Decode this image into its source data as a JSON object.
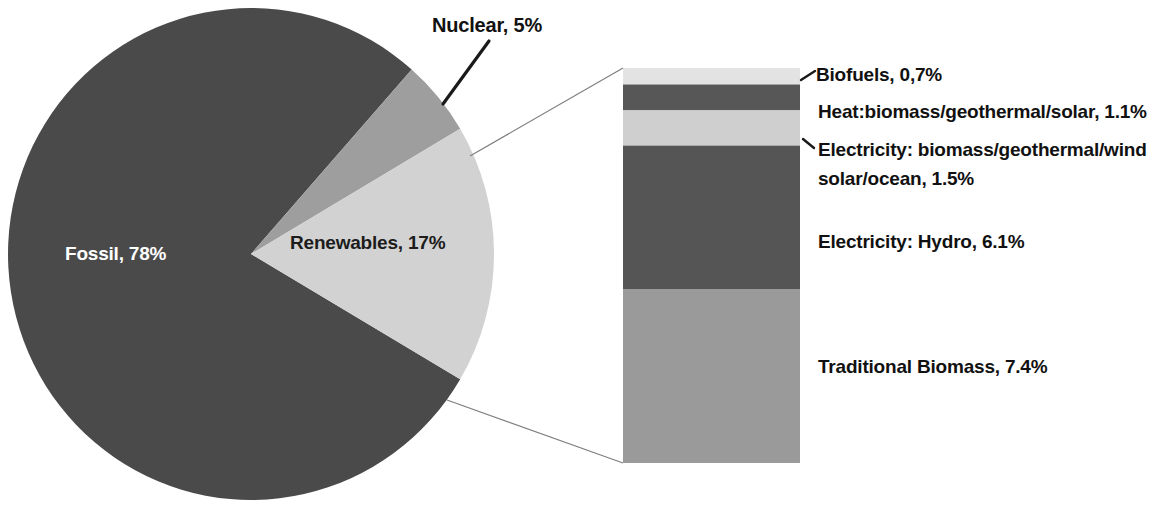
{
  "chart_data": {
    "type": "pie",
    "title": "",
    "subtitle": "",
    "xlabel": "",
    "ylabel": "",
    "legend_position": "none",
    "grid": false,
    "units": "percent of global final energy consumption",
    "categories": [
      "Fossil",
      "Nuclear",
      "Renewables"
    ],
    "values": [
      78,
      5,
      17
    ],
    "labels": [
      "Fossil, 78%",
      "Nuclear, 5%",
      "Renewables, 17%"
    ],
    "colors": [
      "#4a4a4a",
      "#9e9e9e",
      "#d2d2d2"
    ],
    "breakout": {
      "type": "bar",
      "orientation": "vertical-stacked",
      "of_category": "Renewables",
      "total": 16.8,
      "categories": [
        "Biofuels",
        "Heat:biomass/geothermal/solar",
        "Electricity: biomass/geothermal/wind solar/ocean",
        "Electricity: Hydro",
        "Traditional Biomass"
      ],
      "values": [
        0.7,
        1.1,
        1.5,
        6.1,
        7.4
      ],
      "labels": [
        "Biofuels, 0,7%",
        "Heat:biomass/geothermal/solar, 1.1%",
        "Electricity: biomass/geothermal/wind solar/ocean, 1.5%",
        "Electricity: Hydro, 6.1%",
        "Traditional Biomass, 7.4%"
      ],
      "colors": [
        "#e3e3e3",
        "#575757",
        "#cfcfcf",
        "#555555",
        "#9a9a9a"
      ]
    }
  },
  "pie": {
    "slices": [
      {
        "label": "Fossil, 78%",
        "name": "Fossil",
        "percent": 78,
        "color": "#4a4a4a"
      },
      {
        "label": "Nuclear, 5%",
        "name": "Nuclear",
        "percent": 5,
        "color": "#9e9e9e"
      },
      {
        "label": "Renewables, 17%",
        "name": "Renewables",
        "percent": 17,
        "color": "#d2d2d2"
      }
    ]
  },
  "bar": {
    "segments": [
      {
        "label": "Biofuels, 0,7%",
        "name": "Biofuels",
        "percent": 0.7,
        "color": "#e3e3e3"
      },
      {
        "label": "Heat:biomass/geothermal/solar, 1.1%",
        "name": "Heat biomass geothermal solar",
        "percent": 1.1,
        "color": "#575757"
      },
      {
        "label_line1": "Electricity: biomass/geothermal/wind",
        "label_line2": "solar/ocean, 1.5%",
        "label": "Electricity: biomass/geothermal/wind solar/ocean, 1.5%",
        "name": "Electricity renewables",
        "percent": 1.5,
        "color": "#cfcfcf"
      },
      {
        "label": "Electricity: Hydro, 6.1%",
        "name": "Electricity Hydro",
        "percent": 6.1,
        "color": "#555555"
      },
      {
        "label": "Traditional Biomass, 7.4%",
        "name": "Traditional Biomass",
        "percent": 7.4,
        "color": "#9a9a9a"
      }
    ]
  }
}
